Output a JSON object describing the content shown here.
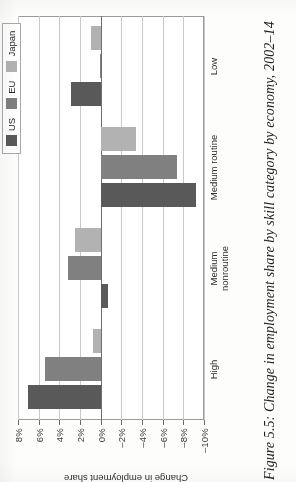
{
  "caption": "Figure 5.5: Change in employment share by skill category by economy, 2002–14",
  "legend": {
    "items": [
      {
        "label": "US",
        "color": "#595959"
      },
      {
        "label": "EU",
        "color": "#808080"
      },
      {
        "label": "Japan",
        "color": "#b2b2b2"
      }
    ]
  },
  "axis": {
    "y_title": "Change in employment share",
    "tick_labels": [
      "8%",
      "6%",
      "4%",
      "2%",
      "0%",
      "–2%",
      "–4%",
      "–6%",
      "–8%",
      "–10%"
    ]
  },
  "chart_data": {
    "type": "bar",
    "title": "Change in employment share by skill category by economy, 2002–14",
    "xlabel": "",
    "ylabel": "Change in employment share",
    "ylim": [
      -10,
      8
    ],
    "ytick_values": [
      8,
      6,
      4,
      2,
      0,
      -2,
      -4,
      -6,
      -8,
      -10
    ],
    "ytick_labels": [
      "8%",
      "6%",
      "4%",
      "2%",
      "0%",
      "–2%",
      "–4%",
      "–6%",
      "–8%",
      "–10%"
    ],
    "grid": true,
    "legend_position": "top-right",
    "units": "percentage points",
    "categories": [
      "High",
      "Medium nonroutine",
      "Medium routine",
      "Low"
    ],
    "series": [
      {
        "name": "US",
        "color": "#595959",
        "values": [
          7.0,
          -0.7,
          -9.2,
          2.9
        ]
      },
      {
        "name": "EU",
        "color": "#808080",
        "values": [
          5.4,
          3.2,
          -7.4,
          0.1
        ]
      },
      {
        "name": "Japan",
        "color": "#b2b2b2",
        "values": [
          0.7,
          2.5,
          -3.4,
          0.9
        ]
      }
    ]
  }
}
